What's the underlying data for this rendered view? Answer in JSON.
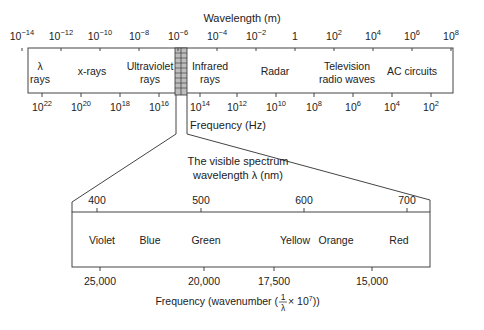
{
  "top_spectrum": {
    "axis_title_top": "Wavelength (m)",
    "wavelength_ticks": [
      {
        "base": "10",
        "exp": "−14",
        "x": 22
      },
      {
        "base": "10",
        "exp": "−12",
        "x": 61
      },
      {
        "base": "10",
        "exp": "−10",
        "x": 100
      },
      {
        "base": "10",
        "exp": "−8",
        "x": 139
      },
      {
        "base": "10",
        "exp": "−6",
        "x": 178
      },
      {
        "base": "10",
        "exp": "−4",
        "x": 217
      },
      {
        "base": "10",
        "exp": "−2",
        "x": 256
      },
      {
        "base": "1",
        "exp": "",
        "x": 295
      },
      {
        "base": "10",
        "exp": "2",
        "x": 334
      },
      {
        "base": "10",
        "exp": "4",
        "x": 373
      },
      {
        "base": "10",
        "exp": "6",
        "x": 412
      },
      {
        "base": "10",
        "exp": "8",
        "x": 451
      }
    ],
    "bands": [
      {
        "line1": "λ",
        "line2": "rays",
        "x": 40
      },
      {
        "line1": "x-rays",
        "line2": "",
        "x": 92
      },
      {
        "line1": "Ultraviolet",
        "line2": "rays",
        "x": 150
      },
      {
        "line1": "Infrared",
        "line2": "rays",
        "x": 210
      },
      {
        "line1": "Radar",
        "line2": "",
        "x": 275
      },
      {
        "line1": "Television",
        "line2": "radio waves",
        "x": 347
      },
      {
        "line1": "AC circuits",
        "line2": "",
        "x": 412
      }
    ],
    "frequency_ticks": [
      {
        "base": "10",
        "exp": "22",
        "x": 42
      },
      {
        "base": "10",
        "exp": "20",
        "x": 81
      },
      {
        "base": "10",
        "exp": "18",
        "x": 120
      },
      {
        "base": "10",
        "exp": "16",
        "x": 159
      },
      {
        "base": "10",
        "exp": "14",
        "x": 200
      },
      {
        "base": "10",
        "exp": "12",
        "x": 237
      },
      {
        "base": "10",
        "exp": "10",
        "x": 276
      },
      {
        "base": "10",
        "exp": "8",
        "x": 314
      },
      {
        "base": "10",
        "exp": "6",
        "x": 353
      },
      {
        "base": "10",
        "exp": "4",
        "x": 392
      },
      {
        "base": "10",
        "exp": "2",
        "x": 431
      }
    ],
    "axis_title_bottom": "Frequency (Hz)"
  },
  "visible_spectrum": {
    "title_line1": "The visible spectrum",
    "title_line2": "wavelength λ (nm)",
    "wavelength_ticks": [
      {
        "label": "400",
        "x": 97
      },
      {
        "label": "500",
        "x": 201
      },
      {
        "label": "600",
        "x": 304
      },
      {
        "label": "700",
        "x": 407
      }
    ],
    "colors": [
      {
        "label": "Violet",
        "x": 102
      },
      {
        "label": "Blue",
        "x": 150
      },
      {
        "label": "Green",
        "x": 206
      },
      {
        "label": "Yellow",
        "x": 295
      },
      {
        "label": "Orange",
        "x": 336
      },
      {
        "label": "Red",
        "x": 399
      }
    ],
    "wavenumber_ticks": [
      {
        "label": "25,000",
        "x": 100
      },
      {
        "label": "20,000",
        "x": 204
      },
      {
        "label": "17,500",
        "x": 274
      },
      {
        "label": "15,000",
        "x": 372
      }
    ],
    "axis_title_prefix": "Frequency (wavenumber (",
    "fraction_num": "1",
    "fraction_den": "λ",
    "axis_title_suffix_base": " × 10",
    "axis_title_suffix_exp": "7",
    "axis_title_close": "))"
  }
}
